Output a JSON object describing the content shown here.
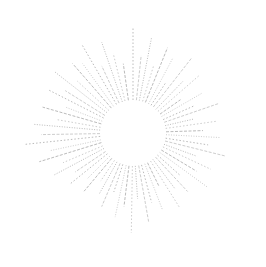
{
  "illustration": {
    "name": "dashed-sunburst",
    "center": [
      133,
      133
    ],
    "inner_radius": 33,
    "ray_color": "#9a9a9a",
    "background": "#ffffff",
    "rays": [
      {
        "a": -90,
        "r": 105
      },
      {
        "a": -84,
        "r": 78
      },
      {
        "a": -79,
        "r": 98
      },
      {
        "a": -73,
        "r": 70
      },
      {
        "a": -68,
        "r": 92
      },
      {
        "a": -62,
        "r": 85
      },
      {
        "a": -57,
        "r": 60
      },
      {
        "a": -52,
        "r": 96
      },
      {
        "a": -46,
        "r": 72
      },
      {
        "a": -41,
        "r": 88
      },
      {
        "a": -35,
        "r": 58
      },
      {
        "a": -30,
        "r": 80
      },
      {
        "a": -24,
        "r": 66
      },
      {
        "a": -19,
        "r": 90
      },
      {
        "a": -13,
        "r": 62
      },
      {
        "a": -8,
        "r": 84
      },
      {
        "a": -2,
        "r": 70
      },
      {
        "a": 3,
        "r": 88
      },
      {
        "a": 9,
        "r": 76
      },
      {
        "a": 14,
        "r": 95
      },
      {
        "a": 20,
        "r": 68
      },
      {
        "a": 25,
        "r": 86
      },
      {
        "a": 31,
        "r": 74
      },
      {
        "a": 36,
        "r": 92
      },
      {
        "a": 42,
        "r": 64
      },
      {
        "a": 47,
        "r": 80
      },
      {
        "a": 53,
        "r": 70
      },
      {
        "a": 58,
        "r": 88
      },
      {
        "a": 64,
        "r": 60
      },
      {
        "a": 69,
        "r": 82
      },
      {
        "a": 75,
        "r": 72
      },
      {
        "a": 80,
        "r": 90
      },
      {
        "a": 86,
        "r": 66
      },
      {
        "a": 91,
        "r": 100
      },
      {
        "a": 97,
        "r": 74
      },
      {
        "a": 102,
        "r": 86
      },
      {
        "a": 108,
        "r": 62
      },
      {
        "a": 113,
        "r": 80
      },
      {
        "a": 119,
        "r": 70
      },
      {
        "a": 124,
        "r": 58
      },
      {
        "a": 130,
        "r": 76
      },
      {
        "a": 135,
        "r": 64
      },
      {
        "a": 141,
        "r": 82
      },
      {
        "a": 146,
        "r": 70
      },
      {
        "a": 152,
        "r": 90
      },
      {
        "a": 157,
        "r": 76
      },
      {
        "a": 163,
        "r": 98
      },
      {
        "a": 168,
        "r": 84
      },
      {
        "a": 174,
        "r": 108
      },
      {
        "a": 179,
        "r": 92
      },
      {
        "a": 185,
        "r": 100
      },
      {
        "a": 190,
        "r": 78
      },
      {
        "a": 196,
        "r": 94
      },
      {
        "a": 201,
        "r": 72
      },
      {
        "a": 207,
        "r": 96
      },
      {
        "a": 212,
        "r": 80
      },
      {
        "a": 218,
        "r": 100
      },
      {
        "a": 223,
        "r": 76
      },
      {
        "a": 229,
        "r": 92
      },
      {
        "a": 234,
        "r": 86
      },
      {
        "a": 240,
        "r": 102
      },
      {
        "a": 245,
        "r": 74
      },
      {
        "a": 251,
        "r": 96
      },
      {
        "a": 256,
        "r": 82
      },
      {
        "a": 262,
        "r": 70
      }
    ]
  }
}
